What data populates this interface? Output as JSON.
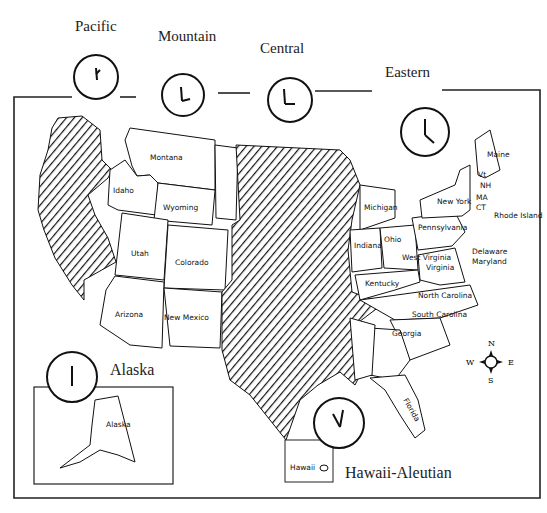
{
  "zones": [
    {
      "name": "Pacific",
      "hour": "1",
      "x": 75,
      "y": 18
    },
    {
      "name": "Mountain",
      "hour": "2",
      "x": 158,
      "y": 28
    },
    {
      "name": "Central",
      "hour": "3",
      "x": 260,
      "y": 40
    },
    {
      "name": "Eastern",
      "hour": "4",
      "x": 385,
      "y": 65
    }
  ],
  "alaska": {
    "title": "Alaska",
    "state_label": "Alaska",
    "hour": "12"
  },
  "hawaii": {
    "title": "Hawaii-Aleutian",
    "state_label": "Hawaii",
    "hour": "11"
  },
  "compass": {
    "n": "N",
    "s": "S",
    "e": "E",
    "w": "W"
  },
  "states": {
    "montana": "Montana",
    "idaho": "Idaho",
    "wyoming": "Wyoming",
    "utah": "Utah",
    "colorado": "Colorado",
    "arizona": "Arizona",
    "new_mexico": "New Mexico",
    "michigan": "Michigan",
    "indiana": "Indiana",
    "ohio": "Ohio",
    "pennsylvania": "Pennsylvania",
    "new_york": "New York",
    "maine": "Maine",
    "vt": "Vt",
    "nh": "NH",
    "ma": "MA",
    "ct": "CT",
    "rhode_island": "Rhode Island",
    "delaware": "Delaware",
    "maryland": "Maryland",
    "west_virginia": "West Virginia",
    "virginia": "Virginia",
    "kentucky": "Kentucky",
    "north_carolina": "North Carolina",
    "south_carolina": "South Carolina",
    "georgia": "Georgia",
    "florida": "Florida",
    "tennessee": "Tennessee",
    "alabama": "Alabama",
    "south_dakota": "South Dakota",
    "nebraska": "Nebraska",
    "kansas": "Kansas",
    "oklahoma": "Oklahoma",
    "texas": "Texas",
    "missouri": "Missouri",
    "arkansas": "Arkansas",
    "louisiana": "Louisiana",
    "illinois": "Illinois",
    "iowa": "Iowa",
    "minnesota": "Minnesota",
    "wisconsin": "Wisconsin",
    "north_dakota": "North Dakota",
    "mississippi": "Mississippi"
  }
}
